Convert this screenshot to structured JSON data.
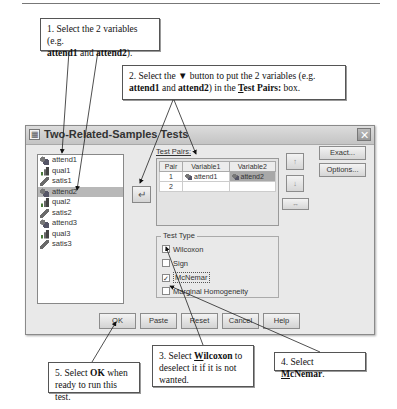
{
  "callouts": {
    "c1": {
      "line1": "1. Select the 2 variables (e.g.",
      "b1": "attend1",
      "mid": " and ",
      "b2": "attend2",
      "end": ")."
    },
    "c2": {
      "line1": "2. Select the ▼ button to put the 2 variables (e.g.",
      "b1": "attend1",
      "mid": " and ",
      "b2": "attend2",
      "mid2": ") in the ",
      "ul": "T",
      "b3": "est Pairs:",
      "end": " box."
    },
    "c3": {
      "pre": "3. Select ",
      "ul": "W",
      "b": "ilcoxon",
      "post": " to deselect it if it is not wanted."
    },
    "c4": {
      "pre": "4. Select ",
      "ul": "M",
      "b": "cNemar",
      "post": "."
    },
    "c5": {
      "pre": "5. Select ",
      "b": "OK",
      "post": " when ready to run this test."
    }
  },
  "dialog": {
    "title": "Two-Related-Samples Tests",
    "close": "✕",
    "variables": [
      {
        "name": "attend1",
        "type": "nominal",
        "selected": false
      },
      {
        "name": "qual1",
        "type": "ordinal",
        "selected": false
      },
      {
        "name": "satis1",
        "type": "scale",
        "selected": false
      },
      {
        "name": "attend2",
        "type": "nominal",
        "selected": true
      },
      {
        "name": "qual2",
        "type": "ordinal",
        "selected": false
      },
      {
        "name": "satis2",
        "type": "scale",
        "selected": false
      },
      {
        "name": "attend3",
        "type": "nominal",
        "selected": false
      },
      {
        "name": "qual3",
        "type": "ordinal",
        "selected": false
      },
      {
        "name": "satis3",
        "type": "scale",
        "selected": false
      }
    ],
    "move_button": "↵",
    "test_pairs_label": "Test Pairs:",
    "pairs_table": {
      "headers": [
        "Pair",
        "Variable1",
        "Variable2"
      ],
      "rows": [
        {
          "pair": "1",
          "var1": "attend1",
          "var2": "attend2"
        },
        {
          "pair": "2",
          "var1": "",
          "var2": ""
        }
      ]
    },
    "up_button": "↑",
    "down_button": "↓",
    "swap_button": "↔",
    "exact_button": "Exact...",
    "options_button": "Options...",
    "test_type": {
      "title": "Test Type",
      "options": [
        {
          "label": "Wilcoxon",
          "checked": false
        },
        {
          "label": "Sign",
          "checked": false
        },
        {
          "label": "McNemar",
          "checked": true
        },
        {
          "label": "Marginal Homogeneity",
          "checked": false
        }
      ]
    },
    "buttons": {
      "ok": "OK",
      "paste": "Paste",
      "reset": "Reset",
      "cancel": "Cancel",
      "help": "Help"
    }
  },
  "check_mark": "✓"
}
